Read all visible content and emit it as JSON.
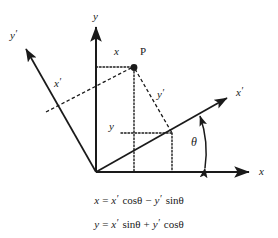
{
  "figure": {
    "type": "geometry-diagram",
    "background": "#ffffff",
    "stroke_color": "#1a1a1a",
    "width": 278,
    "height": 238
  },
  "axes": [
    {
      "id": "x",
      "label": "x",
      "prime": false,
      "kind": "solid-arrow",
      "description": "original horizontal axis"
    },
    {
      "id": "y",
      "label": "y",
      "prime": false,
      "kind": "solid-arrow",
      "description": "original vertical axis"
    },
    {
      "id": "x-prime",
      "label": "x",
      "prime": true,
      "kind": "solid-arrow",
      "description": "rotated horizontal axis"
    },
    {
      "id": "y-prime",
      "label": "y",
      "prime": true,
      "kind": "solid-arrow",
      "description": "rotated vertical axis"
    }
  ],
  "labels": {
    "point": "P",
    "x": "x",
    "y": "y",
    "x_prime": "x",
    "y_prime": "y",
    "x_axis": "x",
    "y_axis": "y",
    "x_prime_axis": "x",
    "y_prime_axis": "y",
    "theta": "θ"
  },
  "formulas": [
    {
      "lhs": "x",
      "eq": "=",
      "term1_var": "x",
      "term1_prime": true,
      "term1_fn": "cosθ",
      "operator": "−",
      "term2_var": "y",
      "term2_prime": true,
      "term2_fn": "sinθ",
      "text": "x = x′ cosθ − y′ sinθ"
    },
    {
      "lhs": "y",
      "eq": "=",
      "term1_var": "x",
      "term1_prime": true,
      "term1_fn": "sinθ",
      "operator": "+",
      "term2_var": "y",
      "term2_prime": true,
      "term2_fn": "cosθ",
      "text": "y = x′ sinθ + y′ cosθ"
    }
  ],
  "geometry": {
    "origin": [
      96,
      172
    ],
    "point_P": [
      134,
      67
    ],
    "x_axis_tip": [
      253,
      172
    ],
    "y_axis_tip": [
      96,
      23
    ],
    "x_prime_tip": [
      231,
      95
    ],
    "y_prime_tip": [
      22,
      45
    ],
    "x_prime_foot": [
      46,
      112
    ],
    "y_prime_foot": [
      172,
      133
    ],
    "theta_degrees": 26
  }
}
